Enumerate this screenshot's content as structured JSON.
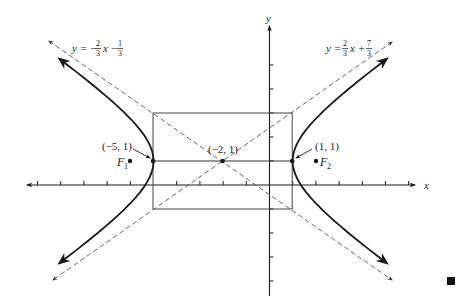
{
  "figure": {
    "type": "hyperbola",
    "center": [
      -2,
      1
    ],
    "a": 3,
    "b": 2,
    "orientation": "horizontal",
    "axis_labels": {
      "x": "x",
      "y": "y"
    },
    "asymptotes": [
      {
        "label_lhs": "y = −",
        "num": "2",
        "den": "3",
        "mid": "x −",
        "num2": "1",
        "den2": "3",
        "slope": -0.6667,
        "intercept": -0.3333
      },
      {
        "label_lhs": "y = ",
        "num": "2",
        "den": "3",
        "mid": "x +",
        "num2": "7",
        "den2": "3",
        "slope": 0.6667,
        "intercept": 2.3333
      }
    ],
    "points": {
      "left_vertex": "(−5, 1)",
      "center": "(−2, 1)",
      "right_vertex": "(1, 1)"
    },
    "foci": {
      "f1": {
        "letter": "F",
        "sub": "1"
      },
      "f2": {
        "letter": "F",
        "sub": "2"
      }
    },
    "box": {
      "x_range": [
        -5,
        1
      ],
      "y_range": [
        -1,
        3
      ]
    },
    "x_ticks": [
      -10,
      -9,
      -8,
      -7,
      -6,
      -4,
      -3,
      -2,
      -1,
      1,
      2,
      3,
      4,
      5,
      6
    ],
    "y_ticks": [
      -4,
      -3,
      -2,
      -1,
      1,
      2,
      3,
      4,
      5
    ],
    "colors": {
      "ink": "#1a1a1a",
      "dashed": "#555555",
      "box": "#444444"
    }
  }
}
